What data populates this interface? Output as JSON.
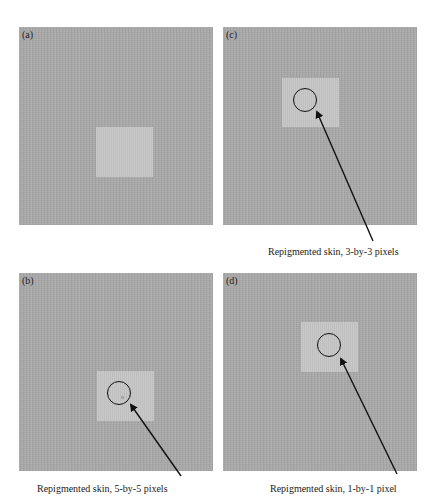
{
  "figure": {
    "cropped_top_text": "",
    "colors": {
      "background": "#a9a9a9",
      "patch": "#c5c5c5",
      "annotation": "#111111"
    },
    "panels": [
      {
        "id": "a",
        "label": "(a)",
        "caption": null
      },
      {
        "id": "b",
        "label": "(b)",
        "caption": "Repigmented skin, 5-by-5 pixels"
      },
      {
        "id": "c",
        "label": "(c)",
        "caption": "Repigmented skin, 3-by-3 pixels"
      },
      {
        "id": "d",
        "label": "(d)",
        "caption": "Repigmented skin, 1-by-1 pixel"
      }
    ]
  }
}
